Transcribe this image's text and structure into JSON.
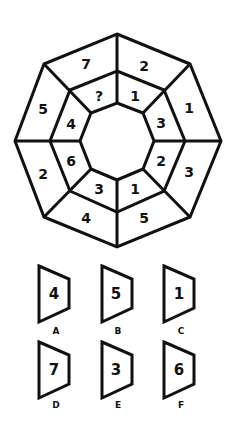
{
  "puzzle": {
    "outer_ring": {
      "top_left": "7",
      "top_right": "2",
      "right_top": "1",
      "right_bottom": "3",
      "bottom_right": "5",
      "bottom_left": "4",
      "left_bottom": "2",
      "left_top": "5"
    },
    "inner_ring": {
      "top_left": "?",
      "top_right": "1",
      "right_top": "3",
      "right_bottom": "2",
      "bottom_right": "1",
      "bottom_left": "3",
      "left_bottom": "6",
      "left_top": "4"
    }
  },
  "options": [
    {
      "label": "A",
      "value": "4"
    },
    {
      "label": "B",
      "value": "5"
    },
    {
      "label": "C",
      "value": "1"
    },
    {
      "label": "D",
      "value": "7"
    },
    {
      "label": "E",
      "value": "3"
    },
    {
      "label": "F",
      "value": "6"
    }
  ]
}
